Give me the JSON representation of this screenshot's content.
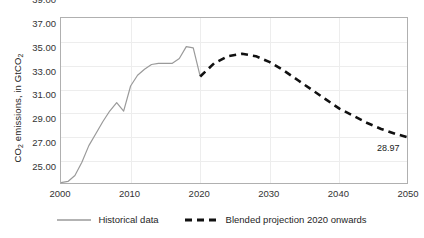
{
  "chart_data": {
    "type": "line",
    "title": "",
    "xlabel": "",
    "ylabel": "CO2 emissions, in GtCO2",
    "ylabel_parts": {
      "pre": "CO",
      "sub1": "2",
      "mid": " emissions, in GtCO",
      "sub2": "2"
    },
    "xlim": [
      2000,
      2050
    ],
    "ylim": [
      25.0,
      39.0
    ],
    "ytick_step": 2.0,
    "xtick_step": 10,
    "grid": true,
    "legend_position": "bottom",
    "xticks": [
      "2000",
      "2010",
      "2020",
      "2030",
      "2040",
      "2050"
    ],
    "yticks": [
      "25.00",
      "27.00",
      "29.00",
      "31.00",
      "33.00",
      "35.00",
      "37.00",
      "39.00"
    ],
    "annotations": [
      {
        "text": "28.97",
        "x": 2050,
        "y": 28.97
      }
    ],
    "series": [
      {
        "name": "Historical data",
        "style": "solid",
        "color": "#9a9a9a",
        "width": 1.2,
        "x": [
          2000,
          2001,
          2002,
          2003,
          2004,
          2005,
          2006,
          2007,
          2008,
          2009,
          2010,
          2011,
          2012,
          2013,
          2014,
          2015,
          2016,
          2017,
          2018,
          2019,
          2020
        ],
        "values": [
          25.2,
          25.3,
          25.8,
          26.9,
          28.3,
          29.3,
          30.3,
          31.2,
          31.9,
          31.2,
          33.3,
          34.2,
          34.7,
          35.1,
          35.2,
          35.2,
          35.2,
          35.6,
          36.6,
          36.5,
          34.1
        ]
      },
      {
        "name": "Blended projection 2020 onwards",
        "style": "dashed",
        "color": "#111111",
        "width": 2.6,
        "x": [
          2020,
          2022,
          2024,
          2026,
          2028,
          2030,
          2032,
          2034,
          2036,
          2038,
          2040,
          2042,
          2044,
          2046,
          2048,
          2050
        ],
        "values": [
          34.1,
          35.2,
          35.8,
          36.0,
          35.8,
          35.3,
          34.6,
          33.8,
          33.0,
          32.2,
          31.4,
          30.8,
          30.2,
          29.7,
          29.3,
          28.97
        ]
      }
    ]
  },
  "legend": {
    "items": [
      {
        "label": "Historical data",
        "style": "solid",
        "color": "#9a9a9a"
      },
      {
        "label": "Blended projection 2020 onwards",
        "style": "dashed",
        "color": "#111111"
      }
    ]
  }
}
